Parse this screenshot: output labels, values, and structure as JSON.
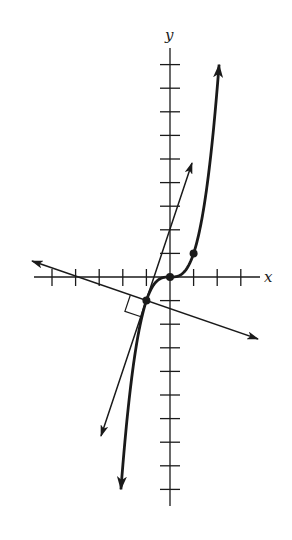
{
  "diagram": {
    "type": "function-graph-with-tangent-and-normal",
    "function": "y = x^3",
    "axes": {
      "x_label": "x",
      "y_label": "y",
      "x_ticks": [
        -5,
        -4,
        -3,
        -2,
        -1,
        1,
        2,
        3
      ],
      "y_ticks": [
        -9,
        -8,
        -7,
        -6,
        -5,
        -4,
        -3,
        -2,
        -1,
        1,
        2,
        3,
        4,
        5,
        6,
        7,
        8,
        9
      ]
    },
    "points": [
      {
        "x": -1,
        "y": -1,
        "role": "point-of-tangency"
      },
      {
        "x": 0,
        "y": 0,
        "role": "inflection-point"
      },
      {
        "x": 1,
        "y": 1,
        "role": "curve-point"
      }
    ],
    "tangent_line": {
      "through": [
        -1,
        -1
      ],
      "slope": 3
    },
    "normal_line": {
      "through": [
        -1,
        -1
      ],
      "slope": -0.3333
    },
    "right_angle_marker": {
      "at": [
        -1,
        -1
      ]
    },
    "colors": {
      "ink": "#1a1a1a",
      "background": "#ffffff"
    }
  }
}
